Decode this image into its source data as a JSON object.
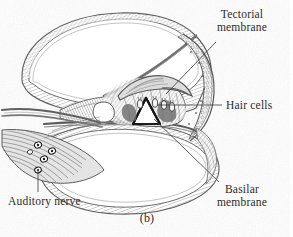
{
  "figure": {
    "caption": "(b)",
    "background_color": "#ffffff",
    "ink_color": "#6f6f6f",
    "text_color": "#2b2b2b"
  },
  "labels": {
    "tectorial": {
      "line1": "Tectorial",
      "line2": "membrane"
    },
    "hair_cells": {
      "line1": "Hair cells"
    },
    "basilar": {
      "line1": "Basilar",
      "line2": "membrane"
    },
    "auditory_nerve": {
      "line1": "Auditory nerve"
    }
  }
}
